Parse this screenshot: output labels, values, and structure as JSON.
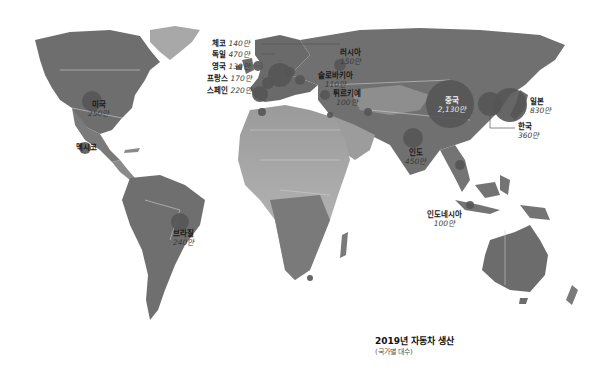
{
  "title": "2019년 자동차 생산",
  "subtitle": "(국가별 대수)",
  "colors": {
    "land_dark": "#6b6b6b",
    "land_mid": "#8a8a8a",
    "land_light": "#b5b5b5",
    "bubble": "#555555",
    "ocean": "#ffffff",
    "border": "#c8c8c8"
  },
  "countries": [
    {
      "name": "체코",
      "value": "140만"
    },
    {
      "name": "독일",
      "value": "470만"
    },
    {
      "name": "영국",
      "value": "130만"
    },
    {
      "name": "프랑스",
      "value": "170만"
    },
    {
      "name": "스페인",
      "value": "220만"
    },
    {
      "name": "러시아",
      "value": "150만"
    },
    {
      "name": "슬로바키아",
      "value": "110만"
    },
    {
      "name": "튀르키예",
      "value": "100만"
    },
    {
      "name": "중국",
      "value": "2,130만"
    },
    {
      "name": "일본",
      "value": "830만"
    },
    {
      "name": "한국",
      "value": "360만"
    },
    {
      "name": "인도",
      "value": "450만"
    },
    {
      "name": "인도네시아",
      "value": "100만"
    },
    {
      "name": "미국",
      "value": "250만"
    },
    {
      "name": "멕시코",
      "value": ""
    },
    {
      "name": "브라질",
      "value": "240만"
    }
  ]
}
